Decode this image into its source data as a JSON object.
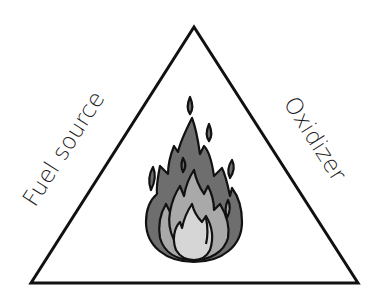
{
  "diagram": {
    "sides": {
      "left": "Fuel source",
      "right": "Oxidizer",
      "bottom": ""
    },
    "center_icon": "flame-icon",
    "colors": {
      "stroke": "#111111",
      "flame_outer": "#6e6e6e",
      "flame_middle": "#a9a9a9",
      "flame_inner": "#d6d6d6",
      "background": "#ffffff"
    }
  }
}
